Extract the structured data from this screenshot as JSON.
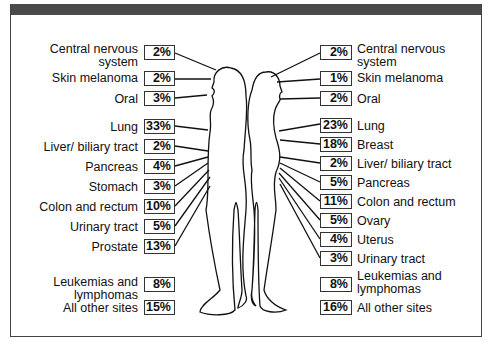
{
  "male": {
    "rows": [
      {
        "label": "Central nervous system",
        "line1": "Central nervous",
        "line2": "system",
        "value": "2%"
      },
      {
        "label": "Skin melanoma",
        "value": "2%"
      },
      {
        "label": "Oral",
        "value": "3%"
      },
      {
        "label": "Lung",
        "value": "33%"
      },
      {
        "label": "Liver/ biliary tract",
        "value": "2%"
      },
      {
        "label": "Pancreas",
        "value": "4%"
      },
      {
        "label": "Stomach",
        "value": "3%"
      },
      {
        "label": "Colon and rectum",
        "value": "10%"
      },
      {
        "label": "Urinary tract",
        "value": "5%"
      },
      {
        "label": "Prostate",
        "value": "13%"
      },
      {
        "label": "Leukemias and lymphomas",
        "line1": "Leukemias and",
        "line2": "lymphomas",
        "value": "8%"
      },
      {
        "label": "All other sites",
        "value": "15%"
      }
    ]
  },
  "female": {
    "rows": [
      {
        "label": "Central nervous system",
        "line1": "Central nervous",
        "line2": "system",
        "value": "2%"
      },
      {
        "label": "Skin melanoma",
        "value": "1%"
      },
      {
        "label": "Oral",
        "value": "2%"
      },
      {
        "label": "Lung",
        "value": "23%"
      },
      {
        "label": "Breast",
        "value": "18%"
      },
      {
        "label": "Liver/ biliary tract",
        "value": "2%"
      },
      {
        "label": "Pancreas",
        "value": "5%"
      },
      {
        "label": "Colon and rectum",
        "value": "11%"
      },
      {
        "label": "Ovary",
        "value": "5%"
      },
      {
        "label": "Uterus",
        "value": "4%"
      },
      {
        "label": "Urinary tract",
        "value": "3%"
      },
      {
        "label": "Leukemias and lymphomas",
        "line1": "Leukemias and",
        "line2": "lymphomas",
        "value": "8%"
      },
      {
        "label": "All other sites",
        "value": "16%"
      }
    ]
  },
  "colors": {
    "line": "#111111",
    "frame": "#444444",
    "topbar": "#4a4a4a"
  }
}
